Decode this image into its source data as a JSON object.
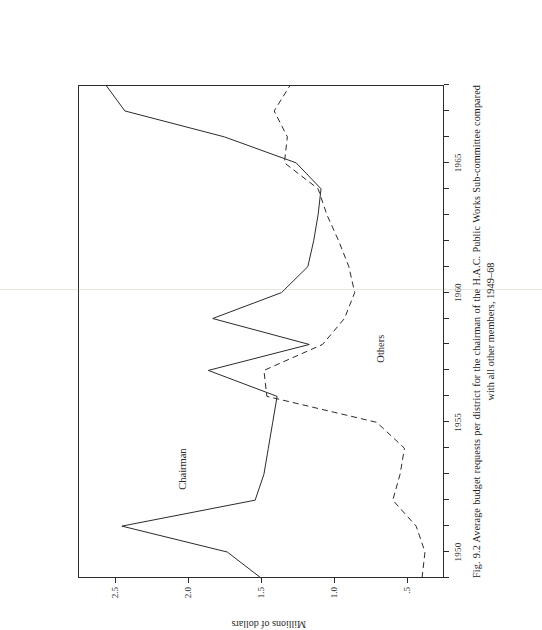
{
  "figure": {
    "caption_number": "Fig. 9.2",
    "caption_text": "Average budget requests per district for the chairman of the H.A.C. Public Works Sub-committee compared with all other members, 1949–68"
  },
  "axes": {
    "x_tick_labels": [
      "1950",
      "1955",
      "1960",
      "1965"
    ],
    "x_tick_years": [
      1950,
      1955,
      1960,
      1965
    ],
    "y_title": "Millions of dollars",
    "y_tick_labels": [
      "2.5",
      "2.0",
      "1.5",
      "1.0",
      ".5"
    ],
    "y_tick_values": [
      2.5,
      2.0,
      1.5,
      1.0,
      0.5
    ]
  },
  "series_labels": {
    "chairman": "Chairman",
    "others": "Others"
  },
  "chart_data": {
    "type": "line",
    "xlabel": "",
    "ylabel": "Millions of dollars",
    "x": [
      1949,
      1950,
      1951,
      1952,
      1953,
      1954,
      1955,
      1956,
      1957,
      1958,
      1959,
      1960,
      1961,
      1962,
      1963,
      1964,
      1965,
      1966,
      1967,
      1968
    ],
    "xlim": [
      1949,
      1968
    ],
    "ylim": [
      0.25,
      2.75
    ],
    "grid": false,
    "legend": "inline-labels",
    "series": [
      {
        "name": "Chairman",
        "style": "solid",
        "color": "#2b2b2b",
        "values": [
          1.5,
          1.73,
          2.45,
          1.54,
          1.48,
          1.45,
          1.42,
          1.39,
          1.86,
          1.17,
          1.83,
          1.36,
          1.18,
          1.14,
          1.11,
          1.09,
          1.26,
          1.75,
          2.43,
          2.56
        ]
      },
      {
        "name": "Others",
        "style": "dashed",
        "color": "#2b2b2b",
        "values": [
          0.4,
          0.38,
          0.44,
          0.6,
          0.55,
          0.52,
          0.71,
          1.46,
          1.48,
          1.08,
          0.93,
          0.86,
          0.9,
          0.97,
          1.05,
          1.11,
          1.34,
          1.32,
          1.41,
          1.3
        ]
      }
    ]
  },
  "colors": {
    "ink": "#2b2b2b",
    "paper": "#ffffff"
  }
}
